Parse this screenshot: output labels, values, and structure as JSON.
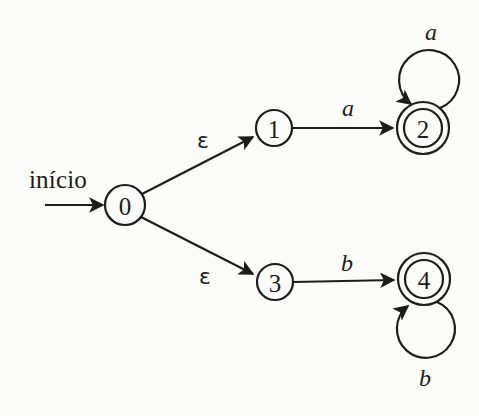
{
  "diagram": {
    "kind": "finite-automaton",
    "title_text": "",
    "background_color": "#fbfbfa",
    "stroke_color": "#1c1c1c",
    "start_label": "início",
    "states": [
      {
        "id": "0",
        "label": "0",
        "cx": 125,
        "cy": 205,
        "r": 20,
        "accepting": false
      },
      {
        "id": "1",
        "label": "1",
        "cx": 274,
        "cy": 128,
        "r": 18,
        "accepting": false
      },
      {
        "id": "2",
        "label": "2",
        "cx": 423,
        "cy": 128,
        "r": 19,
        "r_outer": 26,
        "accepting": true
      },
      {
        "id": "3",
        "label": "3",
        "cx": 275,
        "cy": 282,
        "r": 18,
        "accepting": false
      },
      {
        "id": "4",
        "label": "4",
        "cx": 424,
        "cy": 279,
        "r": 19,
        "r_outer": 26,
        "accepting": true
      }
    ],
    "transitions": [
      {
        "from": "0",
        "to": "1",
        "symbol": "ε",
        "label_x": 203,
        "label_y": 141
      },
      {
        "from": "0",
        "to": "3",
        "symbol": "ε",
        "label_x": 205,
        "label_y": 277
      },
      {
        "from": "1",
        "to": "2",
        "symbol": "a",
        "label_x": 348,
        "label_y": 108
      },
      {
        "from": "3",
        "to": "4",
        "symbol": "b",
        "label_x": 347,
        "label_y": 263
      },
      {
        "from": "2",
        "to": "2",
        "symbol": "a",
        "label_x": 431,
        "label_y": 32,
        "self_loop": "above"
      },
      {
        "from": "4",
        "to": "4",
        "symbol": "b",
        "label_x": 425,
        "label_y": 378,
        "self_loop": "below"
      }
    ]
  }
}
